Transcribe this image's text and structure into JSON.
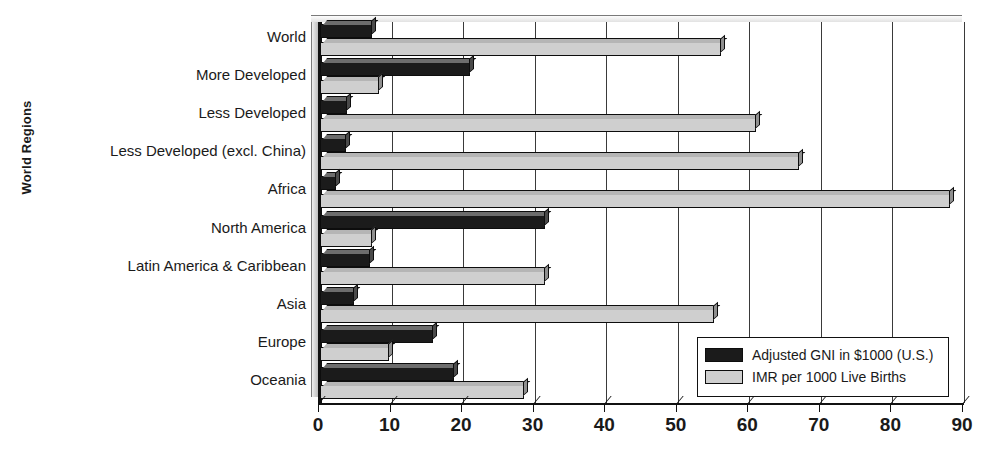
{
  "chart_data": {
    "type": "bar",
    "orientation": "horizontal",
    "title": "",
    "xlabel": "",
    "ylabel": "World Regions",
    "xlim": [
      0,
      90
    ],
    "xticks": [
      0,
      10,
      20,
      30,
      40,
      50,
      60,
      70,
      80,
      90
    ],
    "grid": true,
    "legend_position": "bottom-right",
    "categories": [
      "World",
      "More Developed",
      "Less Developed",
      "Less Developed (excl. China)",
      "Africa",
      "North America",
      "Latin America & Caribbean",
      "Asia",
      "Europe",
      "Oceania"
    ],
    "series": [
      {
        "name": "Adjusted GNI in $1000 (U.S.)",
        "color": "#1b1b1b",
        "values": [
          7.2,
          21.0,
          3.8,
          3.7,
          2.3,
          31.5,
          7.0,
          4.7,
          15.8,
          18.7
        ]
      },
      {
        "name": "IMR per 1000 Live Births",
        "color": "#cfcfcf",
        "values": [
          56.0,
          8.3,
          61.0,
          67.0,
          88.0,
          7.2,
          31.5,
          55.0,
          9.6,
          28.5
        ]
      }
    ]
  },
  "axis": {
    "y_title": "World Regions"
  },
  "legend": {
    "items": [
      {
        "label": "Adjusted GNI in $1000 (U.S.)",
        "swatch": "#1b1b1b"
      },
      {
        "label": "IMR per 1000 Live Births",
        "swatch": "#cfcfcf"
      }
    ]
  }
}
